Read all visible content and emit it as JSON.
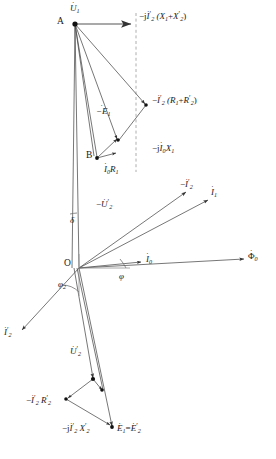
{
  "figure": {
    "type": "phasor-diagram",
    "background_color": "#ffffff",
    "line_color": "#444444",
    "text_color": "#1a1a1a",
    "dashed_axis_color": "#999999"
  },
  "points": [
    {
      "name": "A",
      "label": "A",
      "x": 75,
      "y": 24
    },
    {
      "name": "B",
      "label": "B",
      "x": 97,
      "y": 158
    },
    {
      "name": "O",
      "label": "O",
      "x": 79,
      "y": 268
    }
  ],
  "labels": {
    "u1": "U",
    "u1_sub": "1",
    "neg_j_i2p_x1_x2p": "−j",
    "i2p": "I",
    "i2p_sub": "2",
    "x1_x2p_group": "(X",
    "x1_sub": "1",
    "plus": "+",
    "x2p": "X",
    "x2p_sub": "2",
    "close_paren": ")",
    "neg_i2p_r1_r2p_lead": "−",
    "r_group_open": "(R",
    "r1_sub": "1",
    "r2p": "R",
    "r2p_sub": "2",
    "neg_e1": "−E",
    "e1_sub": "1",
    "neg_j_i0_x1": "−j",
    "i0": "I",
    "i0_sub": "0",
    "x1": "X",
    "i0_r1_i": "I",
    "r1": "R",
    "neg_u2p": "−U",
    "u2p_sub": "2",
    "delta": "δ",
    "phi": "φ",
    "phi2": "φ",
    "phi2_sub": "2",
    "neg_i2p_label": "−I",
    "i1": "I",
    "i1_sub": "1",
    "i0_label": "I",
    "flux": "Φ",
    "flux_sub": "0",
    "i2p_bottomleft": "I",
    "u2p": "U",
    "neg_i2p_r2p": "−I",
    "neg_j_i2p_x2p": "−j",
    "e1_eq_e2p_e1": "E",
    "equals": "=",
    "e1_eq_e2p_e2": "E"
  },
  "annotations": [
    {
      "name": "supply-voltage",
      "text": "U̇₁",
      "x": 75,
      "y": 8,
      "role": "phasor-label"
    },
    {
      "name": "vertex-a",
      "text": "A",
      "x": 60,
      "y": 20,
      "role": "point-label"
    },
    {
      "name": "leakage-reactance-drop",
      "text": "−j İ′₂ (X₁+X′₂)",
      "x": 136,
      "y": 16,
      "role": "phasor-label"
    },
    {
      "name": "resistance-drop",
      "text": "−İ′₂ (R₁+R′₂)",
      "x": 150,
      "y": 100,
      "role": "phasor-label"
    },
    {
      "name": "neg-emf",
      "text": "−Ė₁",
      "x": 97,
      "y": 110,
      "role": "phasor-label"
    },
    {
      "name": "stator-reactance-drop",
      "text": "−jİ₀X₁",
      "x": 152,
      "y": 148,
      "role": "phasor-label"
    },
    {
      "name": "vertex-b",
      "text": "B",
      "x": 88,
      "y": 153,
      "role": "point-label"
    },
    {
      "name": "stator-resistance-drop",
      "text": "İ₀R₁",
      "x": 106,
      "y": 170,
      "role": "phasor-label"
    },
    {
      "name": "neg-rotor-voltage",
      "text": "−U̇′₂",
      "x": 100,
      "y": 205,
      "role": "phasor-label"
    },
    {
      "name": "angle-delta",
      "text": "δ",
      "x": 74,
      "y": 219,
      "role": "angle-label"
    },
    {
      "name": "neg-rotor-current",
      "text": "−İ′₂",
      "x": 184,
      "y": 184,
      "role": "phasor-label"
    },
    {
      "name": "stator-current",
      "text": "İ₁",
      "x": 212,
      "y": 192,
      "role": "phasor-label"
    },
    {
      "name": "magnetizing-current",
      "text": "İ₀",
      "x": 148,
      "y": 260,
      "role": "phasor-label"
    },
    {
      "name": "origin",
      "text": "O",
      "x": 66,
      "y": 262,
      "role": "point-label"
    },
    {
      "name": "angle-phi",
      "text": "φ",
      "x": 122,
      "y": 275,
      "role": "angle-label"
    },
    {
      "name": "angle-phi2",
      "text": "φ₂",
      "x": 62,
      "y": 283,
      "role": "angle-label"
    },
    {
      "name": "main-flux",
      "text": "Φ̇₀",
      "x": 252,
      "y": 256,
      "role": "phasor-label"
    },
    {
      "name": "rotor-current",
      "text": "İ′₂",
      "x": 6,
      "y": 332,
      "role": "phasor-label"
    },
    {
      "name": "rotor-voltage",
      "text": "U̇′₂",
      "x": 72,
      "y": 352,
      "role": "phasor-label"
    },
    {
      "name": "rotor-resistance-drop",
      "text": "−İ′₂R′₂",
      "x": 28,
      "y": 400,
      "role": "phasor-label"
    },
    {
      "name": "rotor-reactance-drop",
      "text": "−jİ′₂X′₂",
      "x": 70,
      "y": 428,
      "role": "phasor-label"
    },
    {
      "name": "emf-equality",
      "text": "Ė₁=Ė′₂",
      "x": 138,
      "y": 427,
      "role": "phasor-label"
    }
  ],
  "geometry": {
    "a": {
      "x": 75,
      "y": 24
    },
    "b": {
      "x": 97,
      "y": 158
    },
    "o": {
      "x": 79,
      "y": 268
    },
    "dashed_vertical": {
      "x": 136,
      "y1": 14,
      "y2": 170
    },
    "u1_arrow_end": {
      "x": 133,
      "y": 24
    },
    "rdrop_vertex": {
      "x": 148,
      "y": 106
    },
    "x1drop_vertex": {
      "x": 118,
      "y": 140
    },
    "i0r1_end": {
      "x": 117,
      "y": 154
    },
    "i2p_neg_end": {
      "x": 188,
      "y": 191
    },
    "i1_end": {
      "x": 210,
      "y": 199
    },
    "i0_end": {
      "x": 143,
      "y": 262
    },
    "flux_end": {
      "x": 246,
      "y": 259
    },
    "i2p_end": {
      "x": 20,
      "y": 331
    },
    "u2p_end": {
      "x": 92,
      "y": 379
    },
    "e1_end": {
      "x": 112,
      "y": 427
    },
    "r2p_vertex": {
      "x": 66,
      "y": 399
    },
    "x2p_vertex": {
      "x": 102,
      "y": 391
    }
  }
}
